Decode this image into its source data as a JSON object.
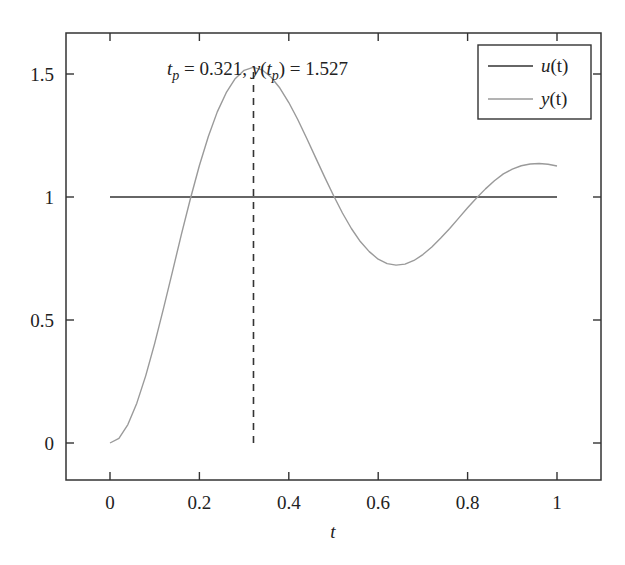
{
  "chart_data": {
    "type": "line",
    "title": "",
    "xlabel": "t",
    "ylabel": "",
    "xlim": [
      -0.1,
      1.1
    ],
    "ylim": [
      -0.15,
      1.667
    ],
    "grid": false,
    "legend_position": "upper right",
    "x_ticks": [
      0,
      0.2,
      0.4,
      0.6,
      0.8,
      1
    ],
    "x_tick_labels": [
      "0",
      "0.2",
      "0.4",
      "0.6",
      "0.8",
      "1"
    ],
    "y_ticks": [
      0,
      0.5,
      1,
      1.5
    ],
    "y_tick_labels": [
      "0",
      "0.5",
      "1",
      "1.5"
    ],
    "series": [
      {
        "name": "u(t)",
        "color": "#333333",
        "x": [
          0,
          1
        ],
        "values": [
          1,
          1
        ]
      },
      {
        "name": "y(t)",
        "color": "#9a9a9a",
        "x": [
          0,
          0.02,
          0.04,
          0.06,
          0.08,
          0.1,
          0.12,
          0.14,
          0.16,
          0.18,
          0.2,
          0.22,
          0.24,
          0.26,
          0.28,
          0.3,
          0.32,
          0.34,
          0.36,
          0.38,
          0.4,
          0.42,
          0.44,
          0.46,
          0.48,
          0.5,
          0.52,
          0.54,
          0.56,
          0.58,
          0.6,
          0.62,
          0.64,
          0.66,
          0.68,
          0.7,
          0.72,
          0.74,
          0.76,
          0.78,
          0.8,
          0.82,
          0.84,
          0.86,
          0.88,
          0.9,
          0.92,
          0.94,
          0.96,
          0.98,
          1.0
        ],
        "values": [
          0,
          0.019,
          0.075,
          0.162,
          0.274,
          0.405,
          0.549,
          0.699,
          0.85,
          0.994,
          1.128,
          1.246,
          1.346,
          1.424,
          1.481,
          1.515,
          1.527,
          1.517,
          1.488,
          1.443,
          1.384,
          1.315,
          1.239,
          1.16,
          1.082,
          1.006,
          0.935,
          0.872,
          0.819,
          0.778,
          0.747,
          0.729,
          0.723,
          0.727,
          0.742,
          0.766,
          0.797,
          0.833,
          0.872,
          0.914,
          0.956,
          0.996,
          1.033,
          1.066,
          1.094,
          1.113,
          1.127,
          1.134,
          1.136,
          1.133,
          1.126
        ]
      }
    ],
    "annotations": [
      {
        "type": "vline-dashed",
        "x": 0.321,
        "y_from": 0,
        "y_to": 1.527,
        "color": "#333333"
      },
      {
        "type": "text",
        "text_parts": {
          "tp_var": "t",
          "tp_sub": "p",
          "tp_eq": " = 0.321, ",
          "y_var": "y",
          "y_open": "(",
          "y_arg": "t",
          "y_sub": "p",
          "y_close": ") = 1.527"
        },
        "text": "t_p = 0.321, y(t_p) = 1.527",
        "tp": 0.321,
        "y_tp": 1.527
      }
    ]
  },
  "legend": {
    "items": [
      {
        "var": "u",
        "args": "(t)",
        "label": "u(t)",
        "color": "#333333"
      },
      {
        "var": "y",
        "args": "(t)",
        "label": "y(t)",
        "color": "#9a9a9a"
      }
    ]
  },
  "axis": {
    "xlabel": "t"
  }
}
